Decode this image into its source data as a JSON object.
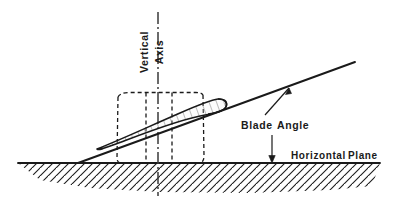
{
  "figure": {
    "background_color": "#ffffff",
    "ink_color": "#1a1a1a",
    "airfoil_fill_color": "#f2f2f2"
  },
  "labels": {
    "vertical_axis": "Vertical Axis",
    "vertical_axis_line1": "Vertical",
    "vertical_axis_line2": "Axis",
    "blade_angle": "Blade Angle",
    "blade_angle_word1": "Blade",
    "blade_angle_word2": "Angle",
    "horizontal_plane": "Horizontal Plane",
    "horizontal_plane_word1": "Horizontal",
    "horizontal_plane_word2": "Plane"
  },
  "elements": {
    "ground_line_name": "horizontal-plane-line",
    "chord_line_name": "blade-chord-line",
    "airfoil_name": "airfoil-section",
    "axis_name": "vertical-center-axis",
    "bounding_box_name": "blade-bounding-box",
    "hatching_name": "ground-hatching"
  },
  "geometry": {
    "ground_y": 163,
    "ground_x_start": 18,
    "ground_x_end": 380,
    "axis_x": 158,
    "axis_y_top": 12,
    "axis_y_bottom": 196,
    "chord_start": [
      78,
      163
    ],
    "chord_end": [
      355,
      62
    ],
    "blade_angle_degrees": 20,
    "box_left": 117,
    "box_right": 203,
    "box_top": 93,
    "box_bottom": 163,
    "airfoil_leading_edge": [
      97,
      149
    ],
    "airfoil_trailing_edge": [
      223,
      103
    ]
  }
}
